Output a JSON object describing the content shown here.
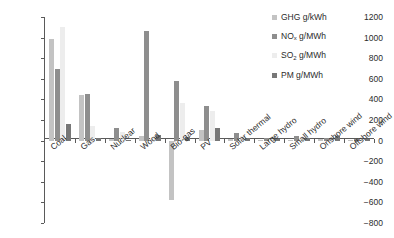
{
  "chart_data": {
    "type": "bar",
    "title": "",
    "subtitle": "",
    "xlabel": "",
    "ylabel": "",
    "ylim": [
      -800,
      1200
    ],
    "ytick_step": 200,
    "grid": false,
    "legend_position": "top-right",
    "categories": [
      "Coal",
      "Gas",
      "Nuclear",
      "Wood",
      "Bio-gas",
      "PV",
      "Solar thermal",
      "Large hydro",
      "Small hydro",
      "Onshore wind",
      "Offshore wind"
    ],
    "ytick_labels": [
      "1200",
      "1000",
      "800",
      "600",
      "400",
      "200",
      "0",
      "−200",
      "−400",
      "−600",
      "−800"
    ],
    "ytick_values": [
      1200,
      1000,
      800,
      600,
      400,
      200,
      0,
      -200,
      -400,
      -600,
      -800
    ],
    "series": [
      {
        "name": "GHG g/kWh",
        "name_base": "GHG",
        "name_sub": "",
        "name_tail": " g/kWh",
        "color": "#c3c3c3",
        "values": [
          990,
          440,
          12,
          40,
          -575,
          105,
          18,
          8,
          10,
          12,
          6
        ]
      },
      {
        "name": "NOx g/MWh",
        "name_base": "NO",
        "name_sub": "x",
        "name_tail": " g/MWh",
        "color": "#8e8e8e",
        "values": [
          700,
          455,
          120,
          1060,
          575,
          335,
          75,
          28,
          42,
          30,
          14
        ]
      },
      {
        "name": "SO2 g/MWh",
        "name_base": "SO",
        "name_sub": "2",
        "name_tail": " g/MWh",
        "color": "#ededed",
        "values": [
          1100,
          145,
          80,
          22,
          365,
          290,
          40,
          20,
          30,
          20,
          10
        ]
      },
      {
        "name": "PM g/MWh",
        "name_base": "PM",
        "name_sub": "",
        "name_tail": " g/MWh",
        "color": "#777777",
        "values": [
          160,
          25,
          10,
          58,
          35,
          120,
          30,
          18,
          24,
          42,
          12
        ]
      }
    ]
  }
}
